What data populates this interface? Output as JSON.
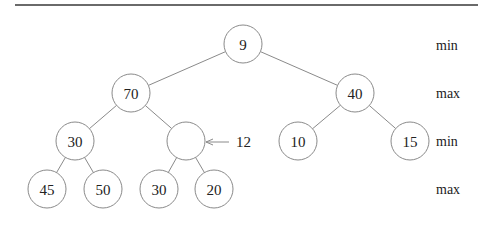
{
  "diagram": {
    "rule": {
      "x1": 15,
      "x2": 478,
      "y": 5
    },
    "node_radius": 19,
    "nodes": [
      {
        "id": "n1",
        "label": "9",
        "x": 243,
        "y": 44
      },
      {
        "id": "n2",
        "label": "70",
        "x": 131,
        "y": 93
      },
      {
        "id": "n3",
        "label": "40",
        "x": 355,
        "y": 93
      },
      {
        "id": "n4",
        "label": "30",
        "x": 75,
        "y": 141
      },
      {
        "id": "n5",
        "label": "",
        "x": 186,
        "y": 141
      },
      {
        "id": "n6",
        "label": "10",
        "x": 298,
        "y": 141
      },
      {
        "id": "n7",
        "label": "15",
        "x": 410,
        "y": 141
      },
      {
        "id": "n8",
        "label": "45",
        "x": 47,
        "y": 189
      },
      {
        "id": "n9",
        "label": "50",
        "x": 103,
        "y": 189
      },
      {
        "id": "n10",
        "label": "30",
        "x": 159,
        "y": 189
      },
      {
        "id": "n11",
        "label": "20",
        "x": 214,
        "y": 189
      }
    ],
    "edges": [
      [
        "n1",
        "n2"
      ],
      [
        "n1",
        "n3"
      ],
      [
        "n2",
        "n4"
      ],
      [
        "n2",
        "n5"
      ],
      [
        "n3",
        "n6"
      ],
      [
        "n3",
        "n7"
      ],
      [
        "n4",
        "n8"
      ],
      [
        "n4",
        "n9"
      ],
      [
        "n5",
        "n10"
      ],
      [
        "n5",
        "n11"
      ]
    ],
    "insert_arrow": {
      "label": "12",
      "from_x": 229,
      "to_x": 206,
      "y": 142,
      "label_x": 236
    },
    "level_labels": [
      {
        "text": "min",
        "y": 45
      },
      {
        "text": "max",
        "y": 93
      },
      {
        "text": "min",
        "y": 141
      },
      {
        "text": "max",
        "y": 189
      }
    ],
    "level_label_x": 436
  }
}
